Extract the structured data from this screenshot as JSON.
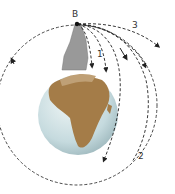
{
  "diagram": {
    "labels": {
      "point": "B",
      "trajectory_1": "1",
      "trajectory_2": "2",
      "trajectory_3": "3"
    },
    "colors": {
      "ocean": "#c9dde0",
      "land": "#a07a4a",
      "mountain": "#9a9a9a",
      "path": "#222222"
    }
  }
}
